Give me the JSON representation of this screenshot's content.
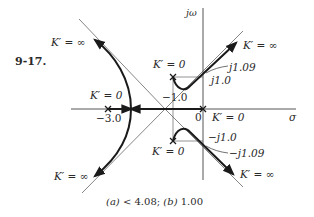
{
  "figure": {
    "problem_number": "9-17.",
    "axis_labels": {
      "imag": "jω",
      "real": "σ"
    },
    "origin_label": "0",
    "labels": {
      "kinf_upper_left": "K′ = ∞",
      "k0_left_pole": "K′ = 0",
      "neg3": "−3.0",
      "neg1": "−1.0",
      "k0_upper_pole": "K′ = 0",
      "kinf_upper_right": "K′ = ∞",
      "j109": "j1.09",
      "j10": "j1.0",
      "k0_origin": "K′ = 0",
      "negj10": "−j1.0",
      "negj109": "−j1.09",
      "k0_lower_pole": "K′ = 0",
      "kinf_lower_right": "K′ = ∞",
      "kinf_lower_left": "K′ = ∞"
    },
    "caption": "(a) < 4.08;  (b) 1.00",
    "caption_parts": {
      "a_label": "(a)",
      "a_value": "< 4.08;",
      "b_label": "(b)",
      "b_value": "1.00"
    },
    "poles": [
      {
        "name": "origin",
        "re": 0,
        "im": 0
      },
      {
        "name": "real",
        "re": -3.0,
        "im": 0
      },
      {
        "name": "upper",
        "re": -1.0,
        "im": 1.0
      },
      {
        "name": "lower",
        "re": -1.0,
        "im": -1.0
      }
    ],
    "asymptote_centroid": -1.0,
    "jw_crossing": 1.09,
    "colors": {
      "locus": "#1a1a1a",
      "axis": "#555555",
      "asymptote": "#666666",
      "text": "#2a2a2a"
    }
  }
}
